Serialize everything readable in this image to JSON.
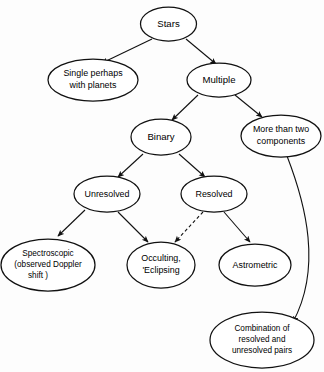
{
  "diagram": {
    "background_color": "#fdfdfd",
    "stroke_color": "#111111",
    "nodes": {
      "stars": {
        "label": "Stars"
      },
      "single": {
        "line1": "Single perhaps",
        "line2": "with planets"
      },
      "multiple": {
        "label": "Multiple"
      },
      "binary": {
        "label": "Binary"
      },
      "more_than_two": {
        "line1": "More than two",
        "line2": "components"
      },
      "unresolved": {
        "label": "Unresolved"
      },
      "resolved": {
        "label": "Resolved"
      },
      "spectroscopic": {
        "line1": "Spectroscopic",
        "line2": "(observed Doppler",
        "line3": "shift )"
      },
      "occulting": {
        "line1": "Occulting,",
        "line2": "'Eclipsing"
      },
      "astrometric": {
        "label": "Astrometric"
      },
      "combination": {
        "line1": "Combination of",
        "line2": "resolved and",
        "line3": "unresolved pairs"
      }
    },
    "edges": [
      {
        "from": "stars",
        "to": "single",
        "style": "solid"
      },
      {
        "from": "stars",
        "to": "multiple",
        "style": "solid"
      },
      {
        "from": "multiple",
        "to": "binary",
        "style": "solid"
      },
      {
        "from": "multiple",
        "to": "more_than_two",
        "style": "solid"
      },
      {
        "from": "binary",
        "to": "unresolved",
        "style": "solid"
      },
      {
        "from": "binary",
        "to": "resolved",
        "style": "solid"
      },
      {
        "from": "unresolved",
        "to": "spectroscopic",
        "style": "solid"
      },
      {
        "from": "unresolved",
        "to": "occulting",
        "style": "solid"
      },
      {
        "from": "resolved",
        "to": "occulting",
        "style": "dashed"
      },
      {
        "from": "resolved",
        "to": "astrometric",
        "style": "solid"
      },
      {
        "from": "more_than_two",
        "to": "combination",
        "style": "solid"
      }
    ]
  }
}
